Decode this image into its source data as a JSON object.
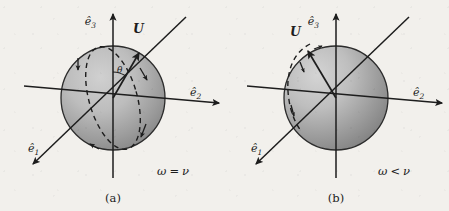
{
  "figure": {
    "background_color": "#f2f0ec",
    "ink_color": "#1d1d1d",
    "sphere_fill_light": "#c9c9c9",
    "sphere_fill_dark": "#8d8d8d",
    "sphere_outline": "#2a2a2a"
  },
  "panels": [
    {
      "id": "a",
      "caption": "(a)",
      "condition_label": "ω = ν",
      "condition_parts": {
        "omega": "ω",
        "relation": "=",
        "nu": "ν"
      },
      "vector_label": "U",
      "angle_label": "θ",
      "axes": [
        {
          "name": "e1",
          "label_base": "ê",
          "label_sub": "1",
          "direction": "lower-left"
        },
        {
          "name": "e2",
          "label_base": "ê",
          "label_sub": "2",
          "direction": "right"
        },
        {
          "name": "e3",
          "label_base": "ê",
          "label_sub": "3",
          "direction": "up"
        }
      ],
      "precession_arc": "full-dashed-ellipse",
      "arc_arrow_count": 4
    },
    {
      "id": "b",
      "caption": "(b)",
      "condition_label": "ω < ν",
      "condition_parts": {
        "omega": "ω",
        "relation": "<",
        "nu": "ν"
      },
      "vector_label": "U",
      "angle_label": "",
      "axes": [
        {
          "name": "e1",
          "label_base": "ê",
          "label_sub": "1",
          "direction": "lower-left"
        },
        {
          "name": "e2",
          "label_base": "ê",
          "label_sub": "2",
          "direction": "right"
        },
        {
          "name": "e3",
          "label_base": "ê",
          "label_sub": "3",
          "direction": "up"
        }
      ],
      "precession_arc": "partial-dashed-arc-upper-left",
      "arc_arrow_count": 3
    }
  ]
}
